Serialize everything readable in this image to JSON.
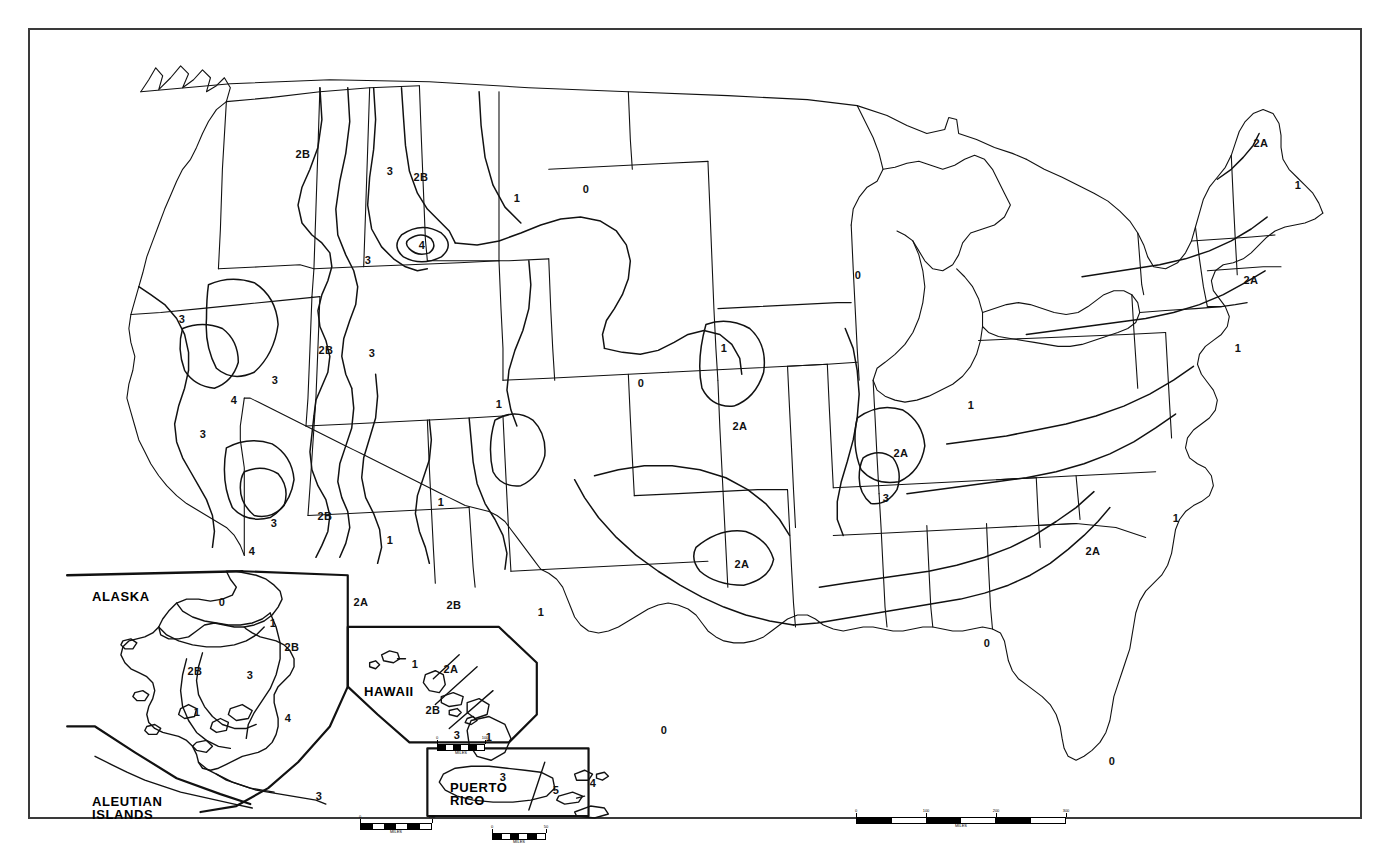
{
  "map": {
    "title": "United States Climate Zone Map",
    "border_color": "#3a3a3a",
    "line_color": "#111111",
    "background": "#ffffff"
  },
  "zones": {
    "legend_values": [
      "0",
      "1",
      "2A",
      "2B",
      "3",
      "4",
      "5"
    ],
    "labels": [
      {
        "id": "z-wa-2b",
        "text": "2B",
        "x": 273,
        "y": 124
      },
      {
        "id": "z-mt-3",
        "text": "3",
        "x": 360,
        "y": 141
      },
      {
        "id": "z-mt-2b",
        "text": "2B",
        "x": 391,
        "y": 147
      },
      {
        "id": "z-nd-1",
        "text": "1",
        "x": 487,
        "y": 168
      },
      {
        "id": "z-nd-0",
        "text": "0",
        "x": 556,
        "y": 159
      },
      {
        "id": "z-id-3",
        "text": "3",
        "x": 338,
        "y": 230
      },
      {
        "id": "z-yellow-4",
        "text": "4",
        "x": 392,
        "y": 215
      },
      {
        "id": "z-ca-3",
        "text": "3",
        "x": 152,
        "y": 289
      },
      {
        "id": "z-nv-2b",
        "text": "2B",
        "x": 296,
        "y": 320
      },
      {
        "id": "z-ut-3",
        "text": "3",
        "x": 342,
        "y": 323
      },
      {
        "id": "z-nv-3b",
        "text": "3",
        "x": 245,
        "y": 350
      },
      {
        "id": "z-ks-0",
        "text": "0",
        "x": 611,
        "y": 353
      },
      {
        "id": "z-ia-1",
        "text": "1",
        "x": 694,
        "y": 318
      },
      {
        "id": "z-wi-0",
        "text": "0",
        "x": 828,
        "y": 245
      },
      {
        "id": "z-ca-4",
        "text": "4",
        "x": 204,
        "y": 370
      },
      {
        "id": "z-ca-3c",
        "text": "3",
        "x": 173,
        "y": 404
      },
      {
        "id": "z-ne-1",
        "text": "1",
        "x": 469,
        "y": 374
      },
      {
        "id": "z-mo-2a",
        "text": "2A",
        "x": 710,
        "y": 396
      },
      {
        "id": "z-il-2a",
        "text": "2A",
        "x": 871,
        "y": 423
      },
      {
        "id": "z-oh-1",
        "text": "1",
        "x": 941,
        "y": 375
      },
      {
        "id": "z-ny-1",
        "text": "1",
        "x": 1208,
        "y": 318
      },
      {
        "id": "z-me-2a",
        "text": "2A",
        "x": 1231,
        "y": 113
      },
      {
        "id": "z-me-1",
        "text": "1",
        "x": 1268,
        "y": 155
      },
      {
        "id": "z-ct-2a",
        "text": "2A",
        "x": 1221,
        "y": 250
      },
      {
        "id": "z-az-2b",
        "text": "2B",
        "x": 295,
        "y": 486
      },
      {
        "id": "z-ut-1",
        "text": "1",
        "x": 360,
        "y": 510
      },
      {
        "id": "z-co-1",
        "text": "1",
        "x": 411,
        "y": 472
      },
      {
        "id": "z-ca-3d",
        "text": "3",
        "x": 244,
        "y": 493
      },
      {
        "id": "z-ca-4b",
        "text": "4",
        "x": 222,
        "y": 521
      },
      {
        "id": "z-ar-3",
        "text": "3",
        "x": 856,
        "y": 468
      },
      {
        "id": "z-sc-2a",
        "text": "2A",
        "x": 1063,
        "y": 521
      },
      {
        "id": "z-nc-1",
        "text": "1",
        "x": 1146,
        "y": 488
      },
      {
        "id": "z-ok-2a",
        "text": "2A",
        "x": 712,
        "y": 534
      },
      {
        "id": "z-az-2a",
        "text": "2A",
        "x": 331,
        "y": 572
      },
      {
        "id": "z-nm-2b",
        "text": "2B",
        "x": 424,
        "y": 575
      },
      {
        "id": "z-tx-1",
        "text": "1",
        "x": 511,
        "y": 582
      },
      {
        "id": "z-ga-0",
        "text": "0",
        "x": 957,
        "y": 613
      },
      {
        "id": "z-tx-0",
        "text": "0",
        "x": 634,
        "y": 700
      },
      {
        "id": "z-fl-0",
        "text": "0",
        "x": 1082,
        "y": 731
      }
    ],
    "alaska_labels": [
      {
        "id": "ak-0",
        "text": "0",
        "x": 192,
        "y": 572
      },
      {
        "id": "ak-1",
        "text": "1",
        "x": 243,
        "y": 593
      },
      {
        "id": "ak-2b",
        "text": "2B",
        "x": 262,
        "y": 617
      },
      {
        "id": "ak-2b2",
        "text": "2B",
        "x": 165,
        "y": 641
      },
      {
        "id": "ak-3",
        "text": "3",
        "x": 220,
        "y": 645
      },
      {
        "id": "ak-1b",
        "text": "1",
        "x": 167,
        "y": 682
      },
      {
        "id": "ak-4",
        "text": "4",
        "x": 258,
        "y": 688
      },
      {
        "id": "ak-3b",
        "text": "3",
        "x": 289,
        "y": 766
      }
    ],
    "hawaii_labels": [
      {
        "id": "hi-1",
        "text": "1",
        "x": 385,
        "y": 634
      },
      {
        "id": "hi-2a",
        "text": "2A",
        "x": 421,
        "y": 639
      },
      {
        "id": "hi-2b",
        "text": "2B",
        "x": 403,
        "y": 680
      },
      {
        "id": "hi-3",
        "text": "3",
        "x": 427,
        "y": 705
      },
      {
        "id": "hi-1b",
        "text": "1",
        "x": 459,
        "y": 707
      }
    ],
    "puertorico_labels": [
      {
        "id": "pr-3",
        "text": "3",
        "x": 473,
        "y": 747
      },
      {
        "id": "pr-5",
        "text": "5",
        "x": 526,
        "y": 760
      },
      {
        "id": "pr-4",
        "text": "4",
        "x": 563,
        "y": 753
      }
    ]
  },
  "insets": [
    {
      "id": "alaska",
      "title": "ALASKA",
      "x": 62,
      "y": 560
    },
    {
      "id": "hawaii",
      "title": "HAWAII",
      "x": 334,
      "y": 655
    },
    {
      "id": "aleutian",
      "title": "ALEUTIAN\nISLANDS",
      "x": 62,
      "y": 765
    },
    {
      "id": "puerto",
      "title": "PUERTO\nRICO",
      "x": 420,
      "y": 751
    }
  ],
  "scalebars": [
    {
      "id": "main",
      "x": 826,
      "y": 787,
      "width": 210,
      "caption": "MILES",
      "ticks": [
        "0",
        "100",
        "200",
        "300"
      ]
    },
    {
      "id": "alaska",
      "x": 330,
      "y": 793,
      "width": 72,
      "caption": "MILES",
      "ticks": [
        "0",
        "200"
      ]
    },
    {
      "id": "hawaii",
      "x": 407,
      "y": 714,
      "width": 48,
      "caption": "MILES",
      "ticks": [
        "0",
        "100"
      ]
    },
    {
      "id": "puerto",
      "x": 462,
      "y": 803,
      "width": 54,
      "caption": "MILES",
      "ticks": [
        "0",
        "50"
      ]
    }
  ]
}
